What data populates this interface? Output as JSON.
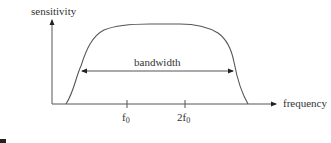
{
  "diagram": {
    "y_axis_label": "sensitivity",
    "x_axis_label": "frequency",
    "bandwidth_label": "bandwidth",
    "ticks": [
      {
        "base": "f",
        "sub": "0",
        "prefix": ""
      },
      {
        "base": "f",
        "sub": "0",
        "prefix": "2"
      }
    ],
    "colors": {
      "line": "#555555",
      "text": "#333333"
    }
  }
}
